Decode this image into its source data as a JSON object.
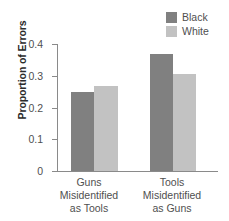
{
  "chart_data": {
    "type": "bar",
    "title": "",
    "xlabel": "",
    "ylabel": "Proportion of Errors",
    "ylim": [
      0,
      0.4
    ],
    "yticks": [
      0.4,
      0.3,
      0.2,
      0.1,
      0
    ],
    "ytick_labels": [
      "0.4",
      "0.3",
      "0.2",
      "0.1",
      "0"
    ],
    "grid": false,
    "legend_position": "top-right",
    "categories": [
      "Guns Misidentified as Tools",
      "Tools Misidentified as Guns"
    ],
    "category_lines": [
      [
        "Guns",
        "Misidentified",
        "as Tools"
      ],
      [
        "Tools",
        "Misidentified",
        "as Guns"
      ]
    ],
    "series": [
      {
        "name": "Black",
        "color": "#808080",
        "values": [
          0.25,
          0.37
        ]
      },
      {
        "name": "White",
        "color": "#c2c2c2",
        "values": [
          0.267,
          0.305
        ]
      }
    ]
  },
  "legend": {
    "items": [
      {
        "label": "Black",
        "color": "#808080"
      },
      {
        "label": "White",
        "color": "#c2c2c2"
      }
    ]
  },
  "axis": {
    "label_y": "Proportion of Errors",
    "tick_0": "0.4",
    "tick_1": "0.3",
    "tick_2": "0.2",
    "tick_3": "0.1",
    "tick_4": "0"
  },
  "categories": {
    "c0_l0": "Guns",
    "c0_l1": "Misidentified",
    "c0_l2": "as Tools",
    "c1_l0": "Tools",
    "c1_l1": "Misidentified",
    "c1_l2": "as Guns"
  },
  "colors": {
    "black_series": "#808080",
    "white_series": "#c2c2c2",
    "axis": "#8a8a8a",
    "text": "#4f4f4f",
    "background": "#ffffff"
  }
}
